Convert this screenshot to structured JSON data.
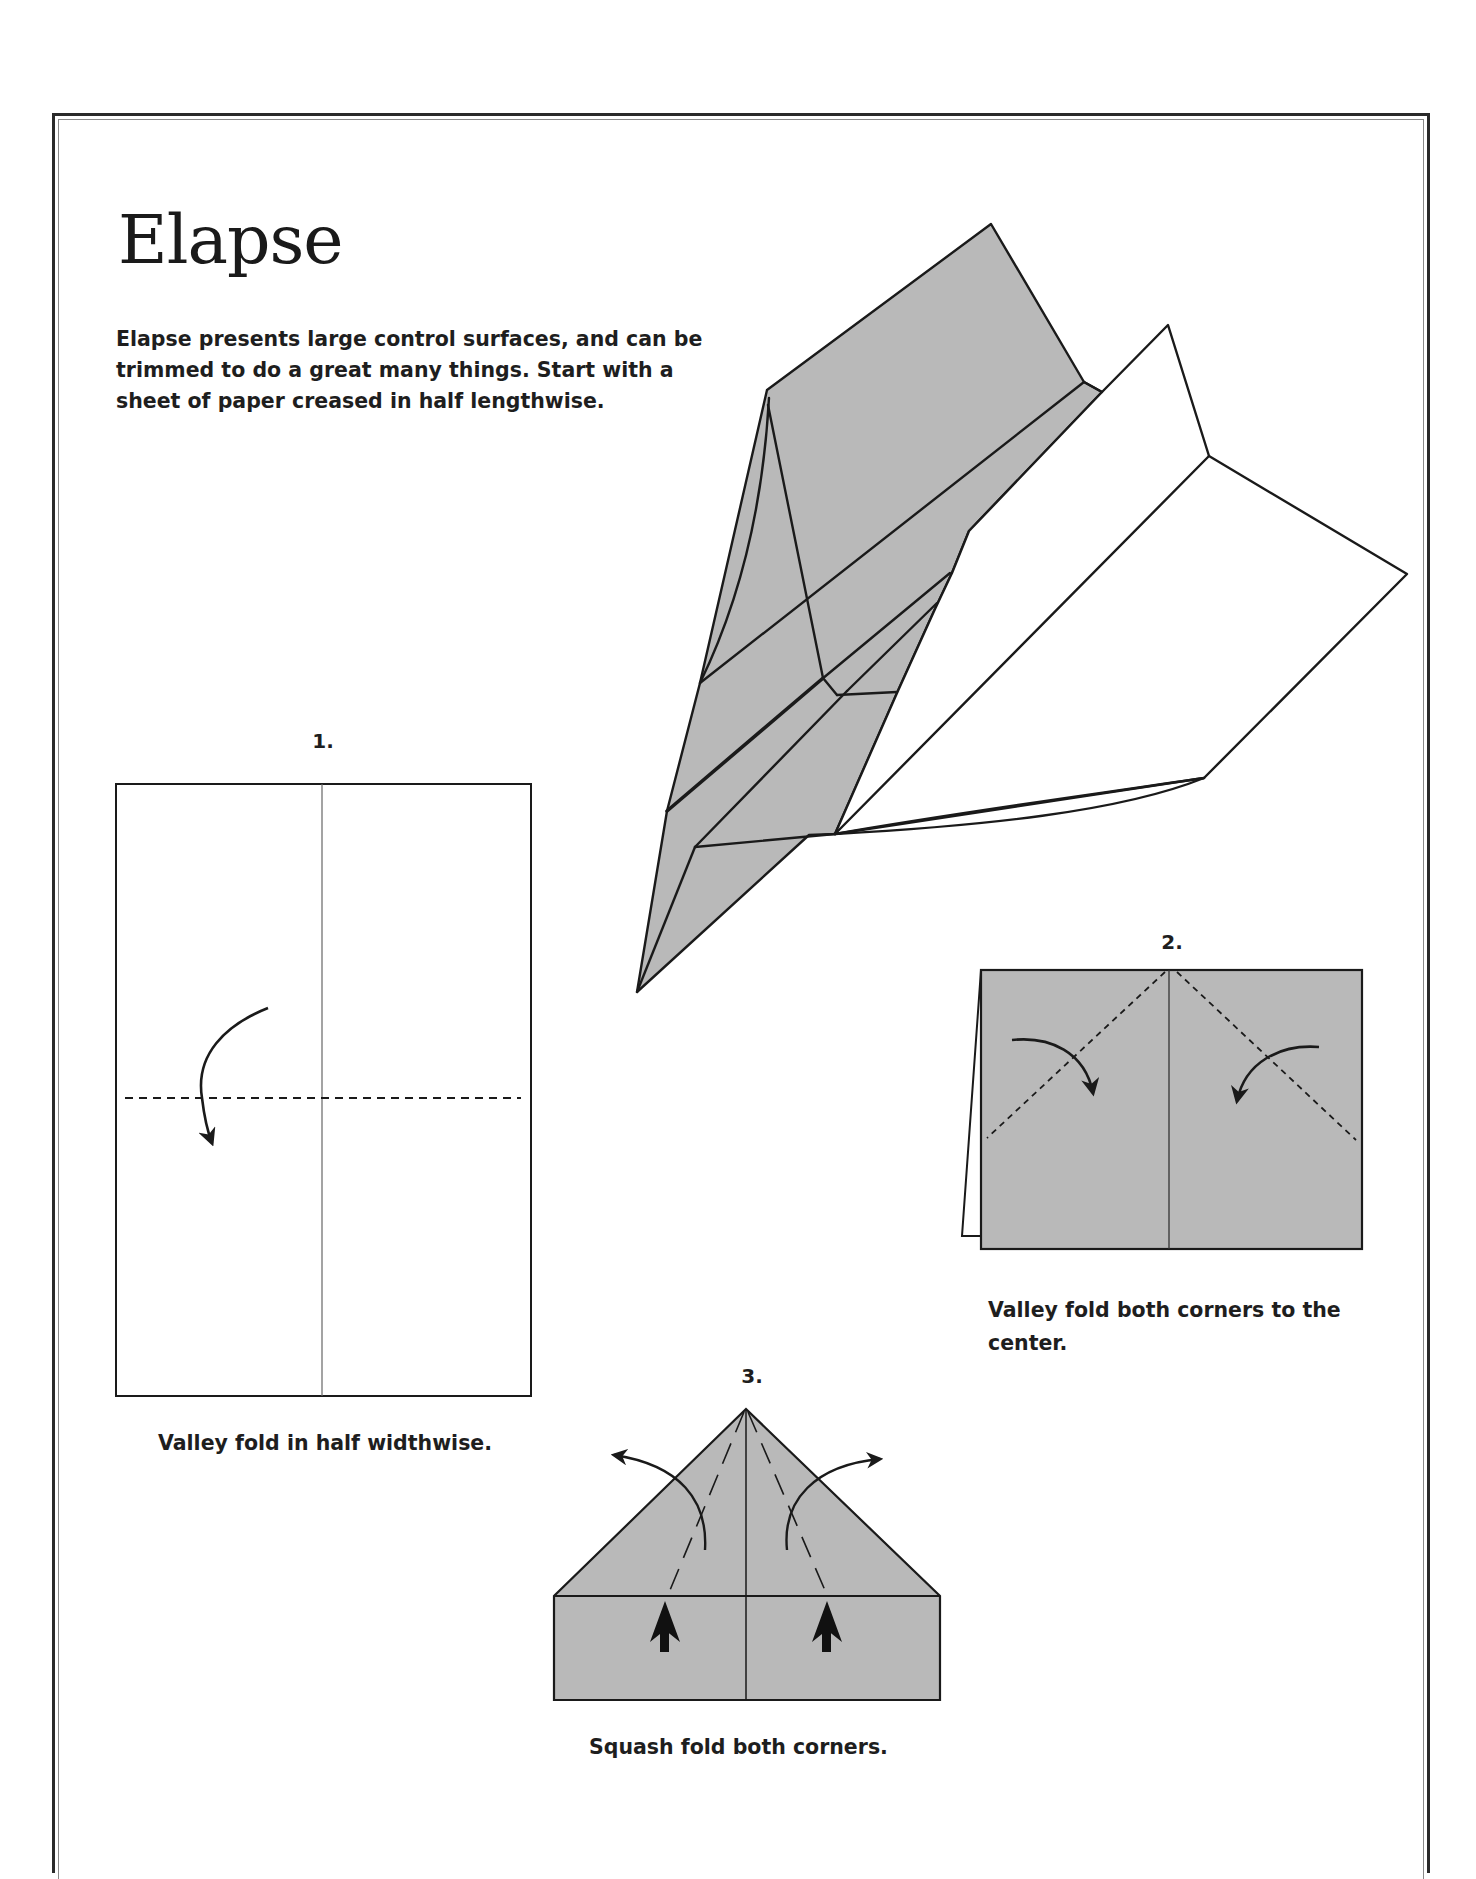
{
  "page": {
    "title": "Elapse",
    "intro": "Elapse presents large control surfaces, and can be trimmed to do a great many things.  Start with a sheet of paper creased in half lengthwise."
  },
  "steps": [
    {
      "number": "1.",
      "caption": "Valley fold in half widthwise."
    },
    {
      "number": "2.",
      "caption_line1": "Valley fold both corners to the",
      "caption_line2": "center."
    },
    {
      "number": "3.",
      "caption": "Squash fold both corners."
    }
  ],
  "colors": {
    "paper_gray": "#b9b9b9",
    "line": "#1a1a1a",
    "background": "#ffffff"
  },
  "diagrams": {
    "finished_plane": "paper-airplane-illustration",
    "step1": "rectangle-with-center-crease-and-dashed-valley-fold",
    "step2": "gray-rectangle-with-diagonal-dashed-folds-and-curved-arrows",
    "step3": "gray-pentagon-with-squash-fold-arrows"
  }
}
